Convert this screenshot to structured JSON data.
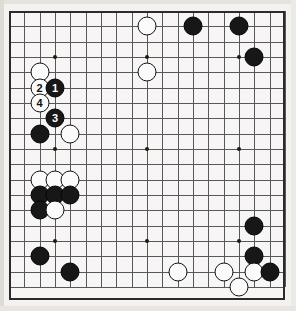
{
  "diagram": {
    "type": "go-board",
    "board_size": 19,
    "geometry": {
      "origin_x": 9,
      "origin_y": 11,
      "spacing": 15.33,
      "stone_diameter": 19
    },
    "colors": {
      "board_background": "#f7f6f4",
      "page_background": "#f4f2f0",
      "grid_line": "#55585c",
      "border": "#2b2b2b",
      "black_stone": "#171717",
      "white_stone": "#fbfbfb",
      "black_label_text": "#ffffff",
      "white_label_text": "#111111"
    },
    "star_points": [
      {
        "col": 3,
        "row": 3
      },
      {
        "col": 9,
        "row": 3
      },
      {
        "col": 15,
        "row": 3
      },
      {
        "col": 3,
        "row": 9
      },
      {
        "col": 9,
        "row": 9
      },
      {
        "col": 15,
        "row": 9
      },
      {
        "col": 3,
        "row": 15
      },
      {
        "col": 9,
        "row": 15
      },
      {
        "col": 15,
        "row": 15
      }
    ],
    "move_numbers": [
      "1",
      "2",
      "3",
      "4"
    ],
    "stones": [
      {
        "col": 9,
        "row": 1,
        "color": "white",
        "label": ""
      },
      {
        "col": 12,
        "row": 1,
        "color": "black",
        "label": ""
      },
      {
        "col": 15,
        "row": 1,
        "color": "black",
        "label": ""
      },
      {
        "col": 16,
        "row": 3,
        "color": "black",
        "label": ""
      },
      {
        "col": 2,
        "row": 4,
        "color": "white",
        "label": ""
      },
      {
        "col": 9,
        "row": 4,
        "color": "white",
        "label": ""
      },
      {
        "col": 2,
        "row": 5,
        "color": "white",
        "label": "2"
      },
      {
        "col": 3,
        "row": 5,
        "color": "black",
        "label": "1"
      },
      {
        "col": 2,
        "row": 6,
        "color": "white",
        "label": "4"
      },
      {
        "col": 3,
        "row": 7,
        "color": "black",
        "label": "3"
      },
      {
        "col": 2,
        "row": 8,
        "color": "black",
        "label": ""
      },
      {
        "col": 4,
        "row": 8,
        "color": "white",
        "label": ""
      },
      {
        "col": 2,
        "row": 11,
        "color": "white",
        "label": ""
      },
      {
        "col": 3,
        "row": 11,
        "color": "white",
        "label": ""
      },
      {
        "col": 4,
        "row": 11,
        "color": "white",
        "label": ""
      },
      {
        "col": 2,
        "row": 12,
        "color": "black",
        "label": ""
      },
      {
        "col": 3,
        "row": 12,
        "color": "black",
        "label": ""
      },
      {
        "col": 4,
        "row": 12,
        "color": "black",
        "label": ""
      },
      {
        "col": 2,
        "row": 13,
        "color": "black",
        "label": ""
      },
      {
        "col": 3,
        "row": 13,
        "color": "white",
        "label": ""
      },
      {
        "col": 16,
        "row": 14,
        "color": "black",
        "label": ""
      },
      {
        "col": 16,
        "row": 16,
        "color": "black",
        "label": ""
      },
      {
        "col": 2,
        "row": 16,
        "color": "black",
        "label": ""
      },
      {
        "col": 11,
        "row": 17,
        "color": "white",
        "label": ""
      },
      {
        "col": 14,
        "row": 17,
        "color": "white",
        "label": ""
      },
      {
        "col": 16,
        "row": 17,
        "color": "white",
        "label": ""
      },
      {
        "col": 17,
        "row": 17,
        "color": "black",
        "label": ""
      },
      {
        "col": 4,
        "row": 17,
        "color": "black",
        "label": ""
      },
      {
        "col": 15,
        "row": 18,
        "color": "white",
        "label": ""
      }
    ]
  }
}
